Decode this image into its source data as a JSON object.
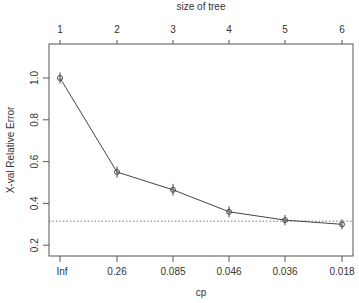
{
  "chart_data": {
    "type": "line",
    "title": "",
    "top_axis_label": "size of tree",
    "top_ticks": [
      "1",
      "2",
      "3",
      "4",
      "5",
      "6"
    ],
    "xlabel": "cp",
    "ylabel": "X-val Relative Error",
    "categories": [
      "Inf",
      "0.26",
      "0.085",
      "0.046",
      "0.036",
      "0.018"
    ],
    "y_ticks": [
      "0.2",
      "0.4",
      "0.6",
      "0.8",
      "1.0"
    ],
    "ylim": [
      0.15,
      1.1
    ],
    "series": [
      {
        "name": "xerror",
        "values": [
          1.0,
          0.55,
          0.465,
          0.36,
          0.32,
          0.3
        ],
        "err": [
          0.012,
          0.012,
          0.014,
          0.012,
          0.01,
          0.01
        ]
      }
    ],
    "reference_line": {
      "y": 0.315,
      "style": "dotted"
    },
    "grid": false,
    "legend": "none"
  }
}
